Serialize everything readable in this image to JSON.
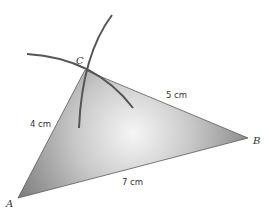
{
  "diagram": {
    "vertices": {
      "A": {
        "label": "A"
      },
      "B": {
        "label": "B"
      },
      "C": {
        "label": "C"
      }
    },
    "sides": {
      "AC": {
        "label": "4 cm",
        "length_cm": 4
      },
      "BC": {
        "label": "5 cm",
        "length_cm": 5
      },
      "AB": {
        "label": "7 cm",
        "length_cm": 7
      }
    },
    "colors": {
      "fill_edge": "#8a8a8a",
      "fill_center": "#f4f4f4",
      "arc": "#555555",
      "outline": "#555555"
    }
  }
}
